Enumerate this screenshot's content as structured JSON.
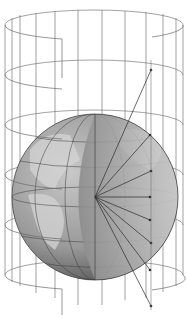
{
  "figure": {
    "title": "",
    "colors": {
      "background": "#ffffff",
      "wireframe": "#6e6e6e",
      "globe_light": "#b8b8b8",
      "globe_dark": "#5a5a5a",
      "land": "#d2d2d2",
      "ray": "#2a2a2a"
    },
    "globe": {
      "cx": 95,
      "cy": 197,
      "r": 83
    },
    "cylinder": {
      "left": 5,
      "right": 183,
      "top": 25,
      "bottom": 300,
      "ry": 15
    },
    "rays": [
      {
        "x": 151,
        "y": 70
      },
      {
        "x": 150,
        "y": 135
      },
      {
        "x": 151,
        "y": 171
      },
      {
        "x": 150,
        "y": 197
      },
      {
        "x": 150,
        "y": 220
      },
      {
        "x": 151,
        "y": 243
      },
      {
        "x": 150,
        "y": 270
      },
      {
        "x": 151,
        "y": 306
      }
    ]
  }
}
